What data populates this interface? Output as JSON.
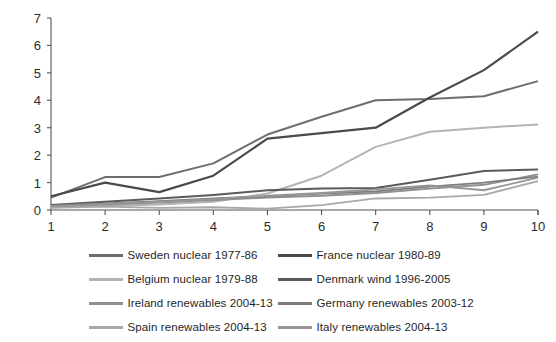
{
  "chart_data": {
    "type": "line",
    "title": "",
    "xlabel": "",
    "ylabel": "",
    "xlim": [
      1,
      10
    ],
    "ylim": [
      0,
      7
    ],
    "grid": false,
    "legend_position": "bottom",
    "x": [
      1,
      2,
      3,
      4,
      5,
      6,
      7,
      8,
      9,
      10
    ],
    "xticklabels": [
      "1",
      "2",
      "3",
      "4",
      "5",
      "6",
      "7",
      "8",
      "9",
      "10"
    ],
    "yticklabels": [
      "0",
      "1",
      "2",
      "3",
      "4",
      "5",
      "6",
      "7"
    ],
    "yticks": [
      0,
      1,
      2,
      3,
      4,
      5,
      6,
      7
    ],
    "series": [
      {
        "name": "Sweden nuclear 1977-86",
        "color": "#6e6e6e",
        "width": 2.0,
        "values": [
          0.45,
          1.2,
          1.2,
          1.7,
          2.75,
          3.4,
          4.0,
          4.05,
          4.15,
          4.7
        ]
      },
      {
        "name": "France nuclear 1980-89",
        "color": "#4a4a4a",
        "width": 2.2,
        "values": [
          0.5,
          1.0,
          0.65,
          1.25,
          2.6,
          2.8,
          3.0,
          4.1,
          5.1,
          6.5
        ]
      },
      {
        "name": "Belgium nuclear 1979-88",
        "color": "#b4b4b4",
        "width": 2.0,
        "values": [
          0.1,
          0.15,
          0.2,
          0.3,
          0.6,
          1.25,
          2.3,
          2.85,
          3.0,
          3.12
        ]
      },
      {
        "name": "Denmark wind 1996-2005",
        "color": "#5a5a5a",
        "width": 2.0,
        "values": [
          0.18,
          0.3,
          0.42,
          0.55,
          0.72,
          0.78,
          0.8,
          1.1,
          1.42,
          1.48
        ]
      },
      {
        "name": "Ireland renewables 2004-13",
        "color": "#8f8f8f",
        "width": 1.8,
        "values": [
          0.12,
          0.2,
          0.27,
          0.36,
          0.45,
          0.52,
          0.62,
          0.78,
          0.92,
          1.3
        ]
      },
      {
        "name": "Germany renewables 2003-12",
        "color": "#7d7d7d",
        "width": 1.8,
        "values": [
          0.16,
          0.24,
          0.32,
          0.42,
          0.5,
          0.6,
          0.68,
          0.85,
          1.0,
          1.22
        ]
      },
      {
        "name": "Spain renewables 2004-13",
        "color": "#a8a8a8",
        "width": 1.8,
        "values": [
          0.08,
          0.12,
          0.08,
          0.1,
          0.05,
          0.18,
          0.42,
          0.45,
          0.55,
          1.05
        ]
      },
      {
        "name": "Italy renewables 2004-13",
        "color": "#969696",
        "width": 1.8,
        "values": [
          0.14,
          0.22,
          0.3,
          0.4,
          0.52,
          0.62,
          0.75,
          0.9,
          0.72,
          1.18
        ]
      }
    ]
  },
  "legend": {
    "entries": [
      {
        "label": "Sweden nuclear 1977-86",
        "color": "#6e6e6e"
      },
      {
        "label": "France nuclear 1980-89",
        "color": "#4a4a4a"
      },
      {
        "label": "Belgium nuclear 1979-88",
        "color": "#b4b4b4"
      },
      {
        "label": "Denmark wind 1996-2005",
        "color": "#5a5a5a"
      },
      {
        "label": "Ireland renewables 2004-13",
        "color": "#8f8f8f"
      },
      {
        "label": "Germany renewables 2003-12",
        "color": "#7d7d7d"
      },
      {
        "label": "Spain renewables 2004-13",
        "color": "#a8a8a8"
      },
      {
        "label": "Italy renewables 2004-13",
        "color": "#969696"
      }
    ]
  }
}
